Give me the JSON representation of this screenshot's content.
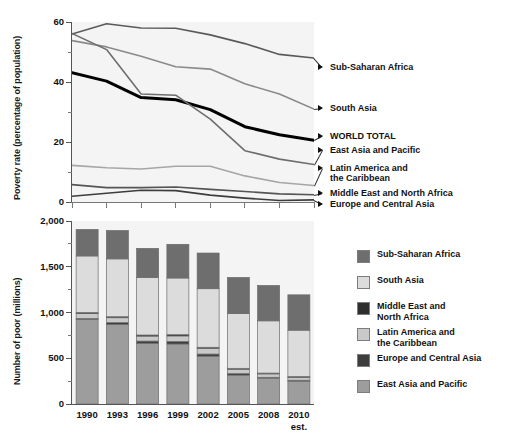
{
  "chart_data": [
    {
      "type": "line",
      "id": "poverty-rate",
      "title": "",
      "ylabel": "Poverty rate (percentage of population)",
      "xlabel": "",
      "ylim": [
        0,
        60
      ],
      "yticks": [
        0,
        20,
        40,
        60
      ],
      "ytick_labels": [
        "0",
        "20",
        "40",
        "60"
      ],
      "x": [
        "1990",
        "1993",
        "1996",
        "1999",
        "2002",
        "2005",
        "2008",
        "2010"
      ],
      "grid": false,
      "legend_position": "right-annotations",
      "series": [
        {
          "name": "Sub-Saharan Africa",
          "color": "#5a5a5a",
          "width": 1.6,
          "values": [
            56.0,
            59.4,
            58.0,
            57.9,
            55.7,
            52.8,
            49.2,
            48.0
          ]
        },
        {
          "name": "South Asia",
          "color": "#8a8a8a",
          "width": 1.6,
          "values": [
            53.8,
            51.7,
            48.6,
            45.1,
            44.3,
            39.4,
            36.0,
            31.0
          ]
        },
        {
          "name": "WORLD TOTAL",
          "color": "#000000",
          "width": 3.0,
          "values": [
            43.1,
            40.3,
            34.8,
            34.1,
            30.8,
            25.1,
            22.4,
            20.6
          ]
        },
        {
          "name": "East Asia and Pacific",
          "color": "#6e6e6e",
          "width": 1.6,
          "values": [
            56.2,
            50.8,
            36.0,
            35.6,
            27.6,
            17.1,
            14.3,
            12.5
          ]
        },
        {
          "name": "Latin America and the Caribbean",
          "color": "#a6a6a6",
          "width": 1.6,
          "values": [
            12.2,
            11.4,
            11.0,
            11.9,
            11.9,
            8.7,
            6.5,
            5.5
          ]
        },
        {
          "name": "Middle East and North Africa",
          "color": "#555555",
          "width": 1.6,
          "values": [
            5.8,
            4.8,
            4.8,
            5.0,
            4.2,
            3.5,
            2.7,
            2.4
          ]
        },
        {
          "name": "Europe and Central Asia",
          "color": "#3d3d3d",
          "width": 1.6,
          "values": [
            1.9,
            2.9,
            3.9,
            3.8,
            2.3,
            1.3,
            0.5,
            0.7
          ]
        }
      ],
      "annotations": [
        {
          "label": "Sub-Saharan Africa",
          "bold": false
        },
        {
          "label": "South Asia",
          "bold": false
        },
        {
          "label": "WORLD TOTAL",
          "bold": true
        },
        {
          "label": "East Asia and Pacific",
          "bold": false
        },
        {
          "label": "Latin America and\nthe Caribbean",
          "bold": false
        },
        {
          "label": "Middle East and North Africa",
          "bold": false
        },
        {
          "label": "Europe and Central Asia",
          "bold": false
        }
      ]
    },
    {
      "type": "bar",
      "id": "number-of-poor",
      "stacked": true,
      "title": "",
      "ylabel": "Number of poor (millions)",
      "xlabel": "",
      "ylim": [
        0,
        2000
      ],
      "yticks": [
        0,
        500,
        1000,
        1500,
        2000
      ],
      "ytick_labels": [
        "0",
        "500",
        "1,000",
        "1,500",
        "2,000"
      ],
      "categories": [
        "1990",
        "1993",
        "1996",
        "1999",
        "2002",
        "2005",
        "2008",
        "2010"
      ],
      "category_notes": [
        "",
        "",
        "",
        "",
        "",
        "",
        "",
        "est."
      ],
      "grid": false,
      "legend_position": "right",
      "series": [
        {
          "name": "East Asia and Pacific",
          "color": "#9d9d9d",
          "values": [
            926,
            871,
            664,
            656,
            523,
            316,
            284,
            250
          ]
        },
        {
          "name": "Europe and Central Asia",
          "color": "#3d3d3d",
          "values": [
            9,
            19,
            24,
            28,
            23,
            17,
            8,
            10
          ]
        },
        {
          "name": "Latin America and the Caribbean",
          "color": "#c9c9c9",
          "values": [
            53,
            53,
            54,
            60,
            62,
            47,
            37,
            32
          ]
        },
        {
          "name": "Middle East and North Africa",
          "color": "#2e2e2e",
          "values": [
            13,
            11,
            12,
            14,
            12,
            10,
            9,
            8
          ]
        },
        {
          "name": "South Asia",
          "color": "#dcdcdc",
          "values": [
            617,
            632,
            630,
            619,
            640,
            598,
            571,
            507
          ]
        },
        {
          "name": "Sub-Saharan Africa",
          "color": "#6e6e6e",
          "values": [
            290,
            310,
            317,
            368,
            390,
            395,
            386,
            386
          ]
        }
      ],
      "totals": [
        1908,
        1896,
        1701,
        1745,
        1650,
        1383,
        1295,
        1193
      ]
    }
  ],
  "top": {
    "ylabel": "Poverty rate (percentage of population)",
    "yticks": [
      "60",
      "40",
      "20",
      "0"
    ],
    "annotations": {
      "sub_saharan_africa": "Sub-Saharan Africa",
      "south_asia": "South Asia",
      "world_total": "WORLD TOTAL",
      "east_asia_pacific": "East Asia and Pacific",
      "latin_america_l1": "Latin America and",
      "latin_america_l2": "the Caribbean",
      "middle_east_north_africa": "Middle East and North Africa",
      "europe_central_asia": "Europe and Central Asia"
    }
  },
  "bottom": {
    "ylabel": "Number of poor (millions)",
    "yticks": [
      "2,000",
      "1,500",
      "1,000",
      "500",
      "0"
    ],
    "xticks": [
      "1990",
      "1993",
      "1996",
      "1999",
      "2002",
      "2005",
      "2008",
      "2010"
    ],
    "xtick_note": "est."
  },
  "legend": {
    "items": [
      {
        "label": "Sub-Saharan Africa",
        "color": "#6e6e6e"
      },
      {
        "label": "South Asia",
        "color": "#dcdcdc"
      },
      {
        "label": "Middle East and\nNorth Africa",
        "color": "#2e2e2e"
      },
      {
        "label": "Latin America and\nthe Caribbean",
        "color": "#c9c9c9"
      },
      {
        "label": "Europe and Central Asia",
        "color": "#3d3d3d"
      },
      {
        "label": "East Asia and Pacific",
        "color": "#9d9d9d"
      }
    ]
  }
}
